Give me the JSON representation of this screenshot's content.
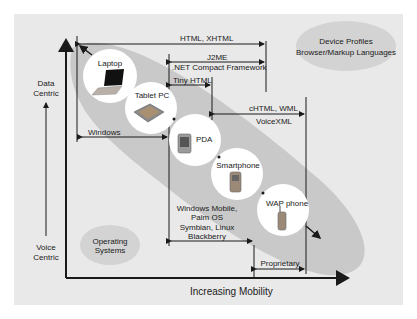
{
  "title_bubble": {
    "line1": "Device Profiles",
    "line2": "Browser/Markup Languages"
  },
  "os_bubble": {
    "line1": "Operating",
    "line2": "Systems"
  },
  "y_axis": {
    "top": {
      "line1": "Data",
      "line2": "Centric"
    },
    "bottom": {
      "line1": "Voice",
      "line2": "Centric"
    }
  },
  "x_axis": {
    "label": "Increasing Mobility"
  },
  "devices": [
    {
      "name": "Laptop"
    },
    {
      "name": "Tablet PC"
    },
    {
      "name": "PDA"
    },
    {
      "name": "Smartphone"
    },
    {
      "name": "WAP phone"
    }
  ],
  "languages": {
    "html": "HTML, XHTML",
    "j2me": "J2ME",
    "netcf": ".NET Compact Framework",
    "tinyhtml": "Tiny HTML",
    "chtml": "cHTML, WML",
    "voicexml": "VoiceXML"
  },
  "os": {
    "windows": "Windows",
    "mobile_line1": "Windows Mobile,",
    "mobile_line2": "Palm OS",
    "mobile_line3": "Symbian, Linux",
    "mobile_line4": "Blackberry",
    "proprietary": "Proprietary"
  },
  "colors": {
    "panel": "#e9e9e9",
    "band": "#c9c9c9",
    "bubble": "#d3d3d3",
    "circle": "#ffffff",
    "line": "#1a1a1a"
  }
}
